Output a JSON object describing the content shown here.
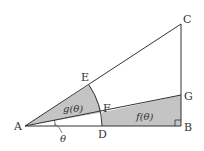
{
  "diagram": {
    "type": "geometry",
    "colors": {
      "line": "#333333",
      "shade": "#bdbdbd",
      "background": "#ffffff"
    },
    "points": {
      "A": {
        "label": "A",
        "x": 25,
        "y": 126
      },
      "B": {
        "label": "B",
        "x": 181,
        "y": 126
      },
      "C": {
        "label": "C",
        "x": 181,
        "y": 24
      },
      "D": {
        "label": "D",
        "x": 102,
        "y": 126
      },
      "E": {
        "label": "E",
        "x": 89,
        "y": 85
      },
      "F": {
        "label": "F",
        "x": 102,
        "y": 112
      },
      "G": {
        "label": "G",
        "x": 181,
        "y": 95
      }
    },
    "region_labels": {
      "g": "g(θ)",
      "f": "f(θ)"
    },
    "angle_label": "θ",
    "right_angle_marker": "B"
  }
}
